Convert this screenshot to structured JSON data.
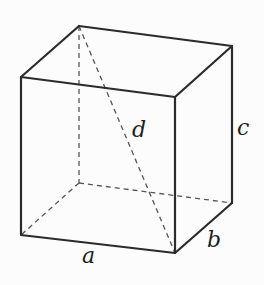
{
  "diagram": {
    "type": "rectangular-box-wireframe",
    "labels": {
      "a": "a",
      "b": "b",
      "c": "c",
      "d": "d"
    },
    "colors": {
      "background": "#fcfcfc",
      "edge": "#2b2b2b",
      "hidden_edge": "#555555"
    },
    "vertices": {
      "front_top_left": [
        21,
        77
      ],
      "front_top_right": [
        175,
        97
      ],
      "front_bottom_left": [
        21,
        235
      ],
      "front_bottom_right": [
        175,
        253
      ],
      "back_top_left": [
        79,
        26
      ],
      "back_top_right": [
        232,
        46
      ],
      "back_bottom_left": [
        79,
        183
      ],
      "back_bottom_right": [
        232,
        203
      ]
    }
  }
}
